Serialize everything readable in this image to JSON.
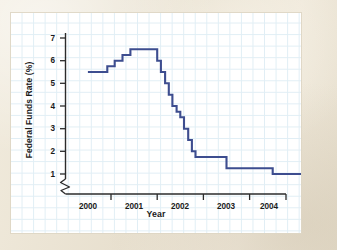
{
  "figure": {
    "source_note": "SOURCE: Federal Reserve",
    "line_color": "#3d4d8f",
    "grid_color": "#d7e9f2",
    "panel_color": "#ffffff",
    "backdrop_color": "#ece4d5",
    "axis_color": "#2b2b2b"
  },
  "chart_data": {
    "type": "line",
    "title": "",
    "xlabel": "Year",
    "ylabel": "Federal Funds Rate (%)",
    "xlim": [
      1999.5,
      2004.6
    ],
    "ylim": [
      0.75,
      7.4
    ],
    "grid": true,
    "legend": "none",
    "axis_break_y": true,
    "x_tick_labels": [
      "2000",
      "2001",
      "2002",
      "2003",
      "2004"
    ],
    "x_tick_values": [
      2000,
      2001,
      2002,
      2003,
      2004
    ],
    "y_tick_labels": [
      "1",
      "2",
      "3",
      "4",
      "5",
      "6",
      "7"
    ],
    "y_tick_values": [
      1,
      2,
      3,
      4,
      5,
      6,
      7
    ],
    "series": [
      {
        "name": "Federal Funds Rate",
        "step": "post",
        "x": [
          1999.5,
          1999.75,
          1999.92,
          2000.08,
          2000.25,
          2000.42,
          2000.92,
          2001.0,
          2001.08,
          2001.17,
          2001.25,
          2001.33,
          2001.42,
          2001.5,
          2001.58,
          2001.67,
          2001.75,
          2001.83,
          2001.92,
          2002.5,
          2003.5,
          2003.92,
          2004.17,
          2004.33,
          2004.42,
          2004.5
        ],
        "y": [
          5.5,
          5.5,
          5.75,
          6.0,
          6.25,
          6.5,
          6.5,
          6.0,
          5.5,
          5.0,
          4.5,
          4.0,
          3.75,
          3.5,
          3.0,
          2.5,
          2.0,
          1.75,
          1.75,
          1.25,
          1.0,
          1.0,
          1.25,
          1.5,
          1.75,
          2.0
        ],
        "values_note": "Stepwise policy rate path: peak 6.50% through 2000, cut to 1.75% end-2001, 1.25% late 2002, 1.00% mid-2003, rising to 2.00% in 2004"
      }
    ]
  }
}
